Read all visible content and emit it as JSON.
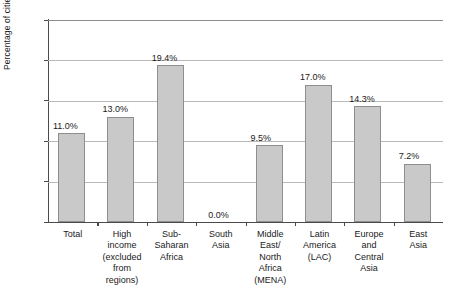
{
  "chart_data": {
    "type": "bar",
    "title": "",
    "xlabel": "",
    "ylabel": "Percentage of cities",
    "ylim": [
      0,
      25
    ],
    "yticks": [
      0,
      5,
      10,
      15,
      20,
      25
    ],
    "ytick_labels": [
      "0",
      "5",
      "10",
      "15",
      "20",
      "25"
    ],
    "grid": true,
    "legend": "none",
    "categories": [
      "Total",
      "High income (excluded from regions)",
      "Sub-Saharan Africa",
      "South Asia",
      "Middle East/North Africa (MENA)",
      "Latin America (LAC)",
      "Europe and Central Asia",
      "East Asia"
    ],
    "category_lines": [
      [
        "Total"
      ],
      [
        "High",
        "income",
        "(excluded",
        "from",
        "regions)"
      ],
      [
        "Sub-",
        "Saharan",
        "Africa"
      ],
      [
        "South",
        "Asia"
      ],
      [
        "Middle",
        "East/",
        "North",
        "Africa",
        "(MENA)"
      ],
      [
        "Latin",
        "America",
        "(LAC)"
      ],
      [
        "Europe",
        "and",
        "Central",
        "Asia"
      ],
      [
        "East",
        "Asia"
      ]
    ],
    "values": [
      11.0,
      13.0,
      19.4,
      0.0,
      9.5,
      17.0,
      14.3,
      7.2
    ],
    "value_labels": [
      "11.0%",
      "13.0%",
      "19.4%",
      "0.0%",
      "9.5%",
      "17.0%",
      "14.3%",
      "7.2%"
    ],
    "bar_color": "#c9c9c9",
    "bar_border_color": "#8e8e8e",
    "axis_color": "#4a4a4a",
    "grid_color": "#b9b9b9"
  }
}
